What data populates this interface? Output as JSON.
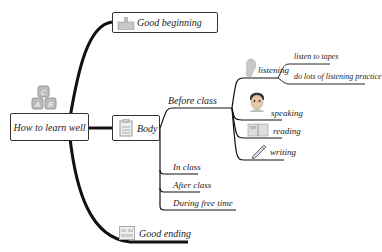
{
  "root": {
    "label": "How to learn well",
    "icon": "abc-blocks-icon"
  },
  "branches": {
    "good_beginning": {
      "label": "Good beginning",
      "icon": "thumbs-up-icon"
    },
    "body": {
      "label": "Body",
      "icon": "clipboard-icon",
      "children": {
        "before_class": {
          "label": "Before class",
          "children": {
            "listening": {
              "label": "listening",
              "icon": "ear-icon",
              "children": [
                "listen to tapes",
                "do lots of listening practice"
              ]
            },
            "speaking": {
              "label": "speaking",
              "icon": "boy-face-icon"
            },
            "reading": {
              "label": "reading",
              "icon": "open-book-icon"
            },
            "writing": {
              "label": "writing",
              "icon": "pencil-icon"
            }
          }
        },
        "in_class": {
          "label": "In class"
        },
        "after_class": {
          "label": "After class"
        },
        "during_free_time": {
          "label": "During free time"
        }
      }
    },
    "good_ending": {
      "label": "Good ending",
      "icon": "document-icon"
    }
  },
  "colors": {
    "line": "#111111",
    "border": "#333333",
    "icon_gray": "#bdbdbd"
  }
}
